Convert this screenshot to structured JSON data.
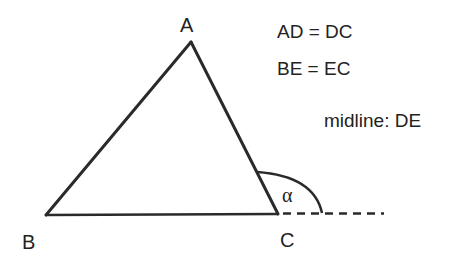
{
  "diagram": {
    "title": "",
    "vertices": [
      {
        "name": "A",
        "x": 191,
        "y": 42,
        "label_x": 186,
        "label_y": 32
      },
      {
        "name": "B",
        "x": 46,
        "y": 215,
        "label_x": 28,
        "label_y": 249
      },
      {
        "name": "C",
        "x": 278,
        "y": 214,
        "label_x": 286,
        "label_y": 247
      }
    ],
    "labels": {
      "A": "A",
      "B": "B",
      "C": "C",
      "angle": "α"
    },
    "notes": [
      "AD = DC",
      "BE = EC",
      "midline: DE"
    ],
    "colors": {
      "stroke": "#2a2a2a",
      "text": "#222222",
      "background": "#ffffff"
    }
  }
}
